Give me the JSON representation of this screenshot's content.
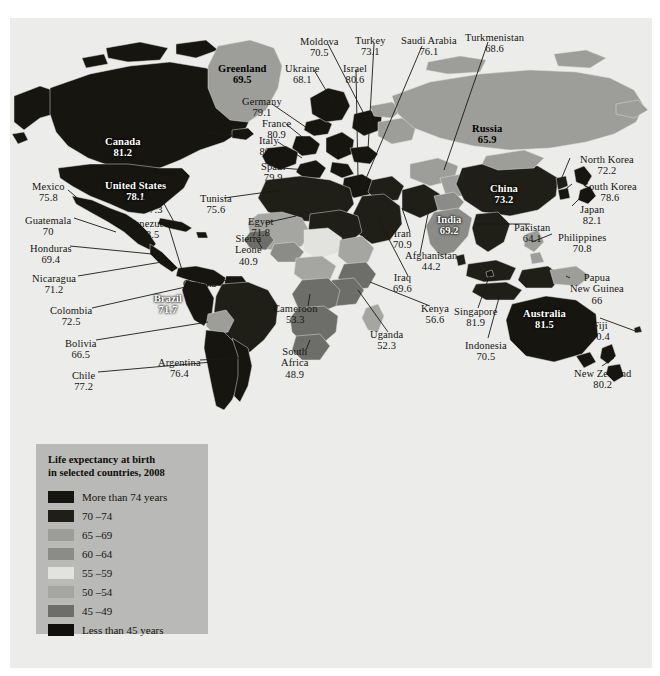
{
  "legend": {
    "title_line1": "Life expectancy at birth",
    "title_line2": "in selected countries, 2008",
    "panel_color": "#b9b9b7",
    "entries": [
      {
        "label": "More than 74 years",
        "color": "#16150f"
      },
      {
        "label": "70 –74",
        "color": "#1f1e17"
      },
      {
        "label": "65 –69",
        "color": "#9d9d9a"
      },
      {
        "label": "60 –64",
        "color": "#8b8b88"
      },
      {
        "label": "55 –59",
        "color": "#e2e2de"
      },
      {
        "label": "50 –54",
        "color": "#a5a5a2"
      },
      {
        "label": "45 –49",
        "color": "#6d6d6a"
      },
      {
        "label": "Less than 45 years",
        "color": "#100f0a"
      }
    ]
  },
  "map": {
    "background": "#ececeb",
    "ocean": "#ececeb"
  },
  "chart_data": {
    "type": "map",
    "title": "Life expectancy at birth in selected countries, 2008",
    "unit": "years",
    "legend_bins": [
      "More than 74 years",
      "70 –74",
      "65 –69",
      "60 –64",
      "55 –59",
      "50 –54",
      "45 –49",
      "Less than 45 years"
    ],
    "countries": [
      {
        "name": "Canada",
        "value": "81.2"
      },
      {
        "name": "United States",
        "value": "78.1"
      },
      {
        "name": "Mexico",
        "value": "75.8"
      },
      {
        "name": "Guatemala",
        "value": "70"
      },
      {
        "name": "Honduras",
        "value": "69.4"
      },
      {
        "name": "Nicaragua",
        "value": "71.2"
      },
      {
        "name": "Cuba",
        "value": "77.3"
      },
      {
        "name": "Venezuela",
        "value": "73.5"
      },
      {
        "name": "Colombia",
        "value": "72.5"
      },
      {
        "name": "Guyana",
        "value": "66.4"
      },
      {
        "name": "Brazil",
        "value": "71.7"
      },
      {
        "name": "Bolivia",
        "value": "66.5"
      },
      {
        "name": "Chile",
        "value": "77.2"
      },
      {
        "name": "Argentina",
        "value": "76.4"
      },
      {
        "name": "Greenland",
        "value": "69.5"
      },
      {
        "name": "Iceland",
        "value": "80.5"
      },
      {
        "name": "France",
        "value": "80.9"
      },
      {
        "name": "Germany",
        "value": "79.1"
      },
      {
        "name": "Italy",
        "value": "80.1"
      },
      {
        "name": "Spain",
        "value": "79.9"
      },
      {
        "name": "Ukraine",
        "value": "68.1"
      },
      {
        "name": "Moldova",
        "value": "70.5"
      },
      {
        "name": "Israel",
        "value": "80.6"
      },
      {
        "name": "Turkey",
        "value": "73.1"
      },
      {
        "name": "Saudi Arabia",
        "value": "76.1"
      },
      {
        "name": "Turkmenistan",
        "value": "68.6"
      },
      {
        "name": "Russia",
        "value": "65.9"
      },
      {
        "name": "Tunisia",
        "value": "75.6"
      },
      {
        "name": "Egypt",
        "value": "71.8"
      },
      {
        "name": "Sierra Leone",
        "value": "40.9"
      },
      {
        "name": "Cameroon",
        "value": "53.3"
      },
      {
        "name": "Uganda",
        "value": "52.3"
      },
      {
        "name": "Kenya",
        "value": "56.6"
      },
      {
        "name": "South Africa",
        "value": "48.9"
      },
      {
        "name": "Iran",
        "value": "70.9"
      },
      {
        "name": "Iraq",
        "value": "69.6"
      },
      {
        "name": "Afghanistan",
        "value": "44.2"
      },
      {
        "name": "Pakistan",
        "value": "64.1"
      },
      {
        "name": "India",
        "value": "69.2"
      },
      {
        "name": "China",
        "value": "73.2"
      },
      {
        "name": "North Korea",
        "value": "72.2"
      },
      {
        "name": "South Korea",
        "value": "78.6"
      },
      {
        "name": "Japan",
        "value": "82.1"
      },
      {
        "name": "Philippines",
        "value": "70.8"
      },
      {
        "name": "Singapore",
        "value": "81.9"
      },
      {
        "name": "Indonesia",
        "value": "70.5"
      },
      {
        "name": "Papua New Guinea",
        "value": "66"
      },
      {
        "name": "Australia",
        "value": "81.5"
      },
      {
        "name": "Fiji",
        "value": "70.4"
      },
      {
        "name": "New Zealand",
        "value": "80.2"
      }
    ]
  },
  "labels": [
    {
      "name": "Canada",
      "line1": "Canada",
      "line2": "81.2",
      "x": 95,
      "y": 118,
      "style": "bold onmap"
    },
    {
      "name": "United States",
      "line1": "United States",
      "line2": "78.1",
      "x": 95,
      "y": 162,
      "style": "bold onmap"
    },
    {
      "name": "Mexico",
      "line1": "Mexico",
      "line2": "75.8",
      "x": 22,
      "y": 163,
      "style": ""
    },
    {
      "name": "Guatemala",
      "line1": "Guatemala",
      "line2": "70",
      "x": 15,
      "y": 197,
      "style": ""
    },
    {
      "name": "Honduras",
      "line1": "Honduras",
      "line2": "69.4",
      "x": 20,
      "y": 225,
      "style": ""
    },
    {
      "name": "Nicaragua",
      "line1": "Nicaragua",
      "line2": "71.2",
      "x": 22,
      "y": 255,
      "style": ""
    },
    {
      "name": "Colombia",
      "line1": "Colombia",
      "line2": "72.5",
      "x": 40,
      "y": 287,
      "style": ""
    },
    {
      "name": "Bolivia",
      "line1": "Bolivia",
      "line2": "66.5",
      "x": 55,
      "y": 320,
      "style": ""
    },
    {
      "name": "Chile",
      "line1": "Chile",
      "line2": "77.2",
      "x": 62,
      "y": 352,
      "style": ""
    },
    {
      "name": "Argentina",
      "line1": "Argentina",
      "line2": "76.4",
      "x": 148,
      "y": 339,
      "style": ""
    },
    {
      "name": "Brazil",
      "line1": "Brazil",
      "line2": "71.7",
      "x": 144,
      "y": 275,
      "style": "bold onmap"
    },
    {
      "name": "Cuba",
      "line1": "Cuba",
      "line2": "77.3",
      "x": 132,
      "y": 175,
      "style": ""
    },
    {
      "name": "Venezuela",
      "line1": "Venezuela",
      "line2": "73.5",
      "x": 118,
      "y": 200,
      "style": ""
    },
    {
      "name": "Guyana",
      "line1": "Guyana",
      "line2": "66.4",
      "x": 173,
      "y": 260,
      "style": ""
    },
    {
      "name": "Greenland",
      "line1": "Greenland",
      "line2": "69.5",
      "x": 208,
      "y": 45,
      "style": "bold"
    },
    {
      "name": "Iceland",
      "line1": "Iceland",
      "line2": "80.5",
      "x": 164,
      "y": 110,
      "style": ""
    },
    {
      "name": "Germany",
      "line1": "Germany",
      "line2": "79.1",
      "x": 232,
      "y": 78,
      "style": ""
    },
    {
      "name": "France",
      "line1": "France",
      "line2": "80.9",
      "x": 252,
      "y": 100,
      "style": ""
    },
    {
      "name": "Italy",
      "line1": "Italy",
      "line2": "80.1",
      "x": 249,
      "y": 117,
      "style": ""
    },
    {
      "name": "Spain",
      "line1": "Spain",
      "line2": "79.9",
      "x": 251,
      "y": 143,
      "style": ""
    },
    {
      "name": "Ukraine",
      "line1": "Ukraine",
      "line2": "68.1",
      "x": 275,
      "y": 45,
      "style": ""
    },
    {
      "name": "Moldova",
      "line1": "Moldova",
      "line2": "70.5",
      "x": 290,
      "y": 18,
      "style": ""
    },
    {
      "name": "Israel",
      "line1": "Israel",
      "line2": "80.6",
      "x": 333,
      "y": 45,
      "style": ""
    },
    {
      "name": "Turkey",
      "line1": "Turkey",
      "line2": "73.1",
      "x": 345,
      "y": 17,
      "style": ""
    },
    {
      "name": "Saudi Arabia",
      "line1": "Saudi Arabia",
      "line2": "76.1",
      "x": 391,
      "y": 17,
      "style": ""
    },
    {
      "name": "Turkmenistan",
      "line1": "Turkmenistan",
      "line2": "68.6",
      "x": 455,
      "y": 14,
      "style": ""
    },
    {
      "name": "Russia",
      "line1": "Russia",
      "line2": "65.9",
      "x": 462,
      "y": 105,
      "style": "bold"
    },
    {
      "name": "Tunisia",
      "line1": "Tunisia",
      "line2": "75.6",
      "x": 190,
      "y": 175,
      "style": ""
    },
    {
      "name": "Egypt",
      "line1": "Egypt",
      "line2": "71.8",
      "x": 238,
      "y": 198,
      "style": ""
    },
    {
      "name": "Sierra Leone",
      "line1": "Sierra",
      "line2": "Leone",
      "line3": "40.9",
      "x": 225,
      "y": 215,
      "style": ""
    },
    {
      "name": "Cameroon",
      "line1": "Cameroon",
      "line2": "53.3",
      "x": 263,
      "y": 285,
      "style": ""
    },
    {
      "name": "South Africa",
      "line1": "South",
      "line2": "Africa",
      "line3": "48.9",
      "x": 271,
      "y": 328,
      "style": ""
    },
    {
      "name": "Uganda",
      "line1": "Uganda",
      "line2": "52.3",
      "x": 360,
      "y": 311,
      "style": ""
    },
    {
      "name": "Kenya",
      "line1": "Kenya",
      "line2": "56.6",
      "x": 411,
      "y": 285,
      "style": ""
    },
    {
      "name": "Iraq",
      "line1": "Iraq",
      "line2": "69.6",
      "x": 383,
      "y": 254,
      "style": ""
    },
    {
      "name": "Iran",
      "line1": "Iran",
      "line2": "70.9",
      "x": 383,
      "y": 210,
      "style": ""
    },
    {
      "name": "Afghanistan",
      "line1": "Afghanistan",
      "line2": "44.2",
      "x": 395,
      "y": 232,
      "style": ""
    },
    {
      "name": "India",
      "line1": "India",
      "line2": "69.2",
      "x": 427,
      "y": 196,
      "style": "bold onmap"
    },
    {
      "name": "China",
      "line1": "China",
      "line2": "73.2",
      "x": 480,
      "y": 165,
      "style": "bold onmap"
    },
    {
      "name": "Pakistan",
      "line1": "Pakistan",
      "line2": "64.1",
      "x": 504,
      "y": 204,
      "style": ""
    },
    {
      "name": "North Korea",
      "line1": "North Korea",
      "line2": "72.2",
      "x": 570,
      "y": 136,
      "style": ""
    },
    {
      "name": "South Korea",
      "line1": "South Korea",
      "line2": "78.6",
      "x": 573,
      "y": 163,
      "style": ""
    },
    {
      "name": "Japan",
      "line1": "Japan",
      "line2": "82.1",
      "x": 570,
      "y": 186,
      "style": ""
    },
    {
      "name": "Philippines",
      "line1": "Philippines",
      "line2": "70.8",
      "x": 548,
      "y": 214,
      "style": ""
    },
    {
      "name": "Papua New Guinea",
      "line1": "Papua",
      "line2": "New Guinea",
      "line3": "66",
      "x": 560,
      "y": 254,
      "style": ""
    },
    {
      "name": "Singapore",
      "line1": "Singapore",
      "line2": "81.9",
      "x": 444,
      "y": 288,
      "style": ""
    },
    {
      "name": "Indonesia",
      "line1": "Indonesia",
      "line2": "70.5",
      "x": 455,
      "y": 322,
      "style": ""
    },
    {
      "name": "Australia",
      "line1": "Australia",
      "line2": "81.5",
      "x": 513,
      "y": 290,
      "style": "bold onmap"
    },
    {
      "name": "Fiji",
      "line1": "Fiji",
      "line2": "70.4",
      "x": 581,
      "y": 302,
      "style": ""
    },
    {
      "name": "New Zealand",
      "line1": "New Zealand",
      "line2": "80.2",
      "x": 564,
      "y": 350,
      "style": ""
    }
  ]
}
